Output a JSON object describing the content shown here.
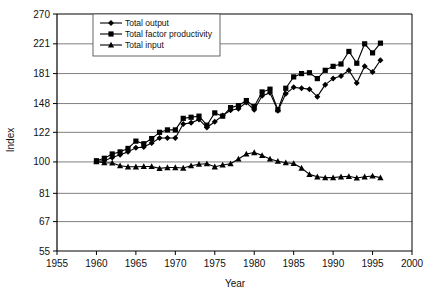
{
  "chart_data": {
    "type": "line",
    "title": "",
    "xlabel": "Year",
    "ylabel": "Index",
    "xlim": [
      1955,
      2000
    ],
    "ylim": [
      55,
      270
    ],
    "yscale": "log",
    "grid": true,
    "legend_position": "top-left-inside",
    "xticks": [
      "1955",
      "1960",
      "1965",
      "1970",
      "1975",
      "1980",
      "1985",
      "1990",
      "1995",
      "2000"
    ],
    "yticks": [
      "55",
      "67",
      "81",
      "100",
      "122",
      "148",
      "181",
      "221",
      "270"
    ],
    "x": [
      1960,
      1961,
      1962,
      1963,
      1964,
      1965,
      1966,
      1967,
      1968,
      1969,
      1970,
      1971,
      1972,
      1973,
      1974,
      1975,
      1976,
      1977,
      1978,
      1979,
      1980,
      1981,
      1982,
      1983,
      1984,
      1985,
      1986,
      1987,
      1988,
      1989,
      1990,
      1991,
      1992,
      1993,
      1994,
      1995,
      1996
    ],
    "series": [
      {
        "name": "Total output",
        "marker": "diamond",
        "values": [
          100.5,
          100.8,
          103.0,
          105.0,
          107.0,
          110.0,
          110.5,
          113.5,
          117.5,
          117.5,
          117.5,
          129.0,
          130.0,
          133.0,
          126.0,
          131.0,
          136.5,
          141.5,
          143.0,
          149.0,
          142.0,
          156.0,
          159.0,
          141.0,
          158.0,
          165.0,
          164.0,
          163.0,
          155.0,
          168.0,
          175.0,
          178.0,
          185.0,
          170.0,
          190.0,
          183.0,
          198.0
        ]
      },
      {
        "name": "Total factor productivity",
        "marker": "square",
        "values": [
          100.8,
          102.5,
          105.5,
          107.0,
          109.5,
          115.0,
          113.0,
          117.0,
          122.0,
          124.0,
          124.0,
          134.0,
          135.0,
          136.0,
          128.0,
          139.0,
          136.0,
          144.0,
          146.0,
          151.0,
          145.0,
          160.0,
          163.0,
          142.0,
          164.0,
          177.0,
          181.0,
          182.0,
          175.0,
          185.0,
          190.0,
          193.0,
          210.0,
          194.0,
          221.0,
          208.0,
          222.0
        ]
      },
      {
        "name": "Total input",
        "marker": "triangle",
        "values": [
          100.2,
          99.5,
          99.3,
          97.5,
          96.8,
          96.8,
          97.0,
          97.0,
          95.8,
          96.3,
          96.3,
          96.0,
          97.5,
          98.5,
          98.8,
          96.8,
          98.0,
          98.8,
          102.0,
          105.5,
          106.5,
          104.5,
          102.0,
          100.5,
          99.5,
          99.0,
          96.0,
          92.0,
          90.5,
          90.0,
          90.0,
          90.5,
          90.8,
          89.8,
          90.5,
          91.0,
          90.0
        ]
      }
    ]
  },
  "legend": {
    "items": [
      {
        "label": "Total output"
      },
      {
        "label": "Total factor productivity"
      },
      {
        "label": "Total input"
      }
    ]
  },
  "colors": {
    "line": "#000000",
    "grid": "#808080",
    "axis": "#000000",
    "background": "#ffffff"
  }
}
